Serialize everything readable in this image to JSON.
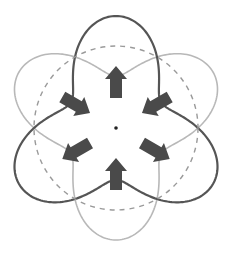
{
  "diagram": {
    "type": "hexapole-deformation-mode",
    "center": {
      "x": 116,
      "y": 128
    },
    "reference_circle": {
      "radius": 82,
      "style": "dashed",
      "color": "#9a9a9a"
    },
    "deformed_shapes": [
      {
        "name": "phase-a",
        "color": "#555555",
        "stroke_width": 2.2,
        "mean_radius": 82,
        "amplitude": 30,
        "lobe_angles_deg": [
          90,
          210,
          330
        ]
      },
      {
        "name": "phase-b",
        "color": "#b8b8b8",
        "stroke_width": 1.6,
        "mean_radius": 82,
        "amplitude": 30,
        "lobe_angles_deg": [
          30,
          150,
          270
        ]
      }
    ],
    "arrows": [
      {
        "position_angle_deg": 90,
        "direction": "outward",
        "color": "#4a4a4a"
      },
      {
        "position_angle_deg": 150,
        "direction": "inward",
        "color": "#4a4a4a"
      },
      {
        "position_angle_deg": 30,
        "direction": "inward",
        "color": "#4a4a4a"
      },
      {
        "position_angle_deg": 210,
        "direction": "outward",
        "color": "#4a4a4a"
      },
      {
        "position_angle_deg": 330,
        "direction": "outward",
        "color": "#4a4a4a"
      },
      {
        "position_angle_deg": 270,
        "direction": "inward",
        "color": "#4a4a4a"
      }
    ],
    "center_dot": {
      "color": "#222222",
      "radius": 1.8
    }
  }
}
